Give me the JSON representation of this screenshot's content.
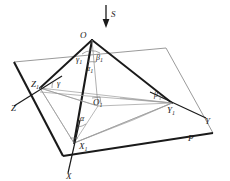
{
  "figure": {
    "colors": {
      "ink": "#1a1a1a",
      "thin": "#6a6a6a",
      "plane": "#8a8a8a",
      "background": "#ffffff"
    },
    "vertices": [
      {
        "id": "O",
        "label": "O",
        "sub": "",
        "x": 92,
        "y": 40,
        "label_x": 80,
        "label_y": 38
      },
      {
        "id": "X1",
        "label": "X",
        "sub": "1",
        "x": 74,
        "y": 143,
        "label_x": 79,
        "label_y": 149
      },
      {
        "id": "Y1",
        "label": "Y",
        "sub": "1",
        "x": 172,
        "y": 103,
        "label_x": 167,
        "label_y": 113
      },
      {
        "id": "Z1",
        "label": "Z",
        "sub": "1",
        "x": 40,
        "y": 88,
        "label_x": 31,
        "label_y": 87
      },
      {
        "id": "O1",
        "label": "O",
        "sub": "1",
        "x": 98,
        "y": 106,
        "label_x": 93,
        "label_y": 105
      }
    ],
    "axes": [
      {
        "id": "X",
        "label": "X",
        "tip_x": 68,
        "tip_y": 173,
        "label_x": 66,
        "label_y": 178
      },
      {
        "id": "Y",
        "label": "Y",
        "tip_x": 206,
        "tip_y": 118,
        "label_x": 206,
        "label_y": 123
      },
      {
        "id": "Z",
        "label": "Z",
        "tip_x": 14,
        "tip_y": 106,
        "label_x": 12,
        "label_y": 110
      }
    ],
    "direction": {
      "id": "S",
      "label": "S",
      "label_x": 111,
      "label_y": 16,
      "arrow_x": 106,
      "arrow_y_top": 5,
      "arrow_y_bottom": 27
    },
    "plane": {
      "id": "P",
      "label": "P",
      "label_x": 189,
      "label_y": 140
    },
    "angles": [
      {
        "id": "alpha",
        "label": "α",
        "sub": "",
        "x": 80,
        "y": 121
      },
      {
        "id": "beta",
        "label": "β",
        "sub": "",
        "x": 154,
        "y": 97
      },
      {
        "id": "gamma",
        "label": "γ",
        "sub": "",
        "x": 57,
        "y": 86
      },
      {
        "id": "alpha1",
        "label": "α",
        "sub": "1",
        "x": 88,
        "y": 70
      },
      {
        "id": "beta1",
        "label": "β",
        "sub": "1",
        "x": 97,
        "y": 59
      },
      {
        "id": "gamma1",
        "label": "γ",
        "sub": "1",
        "x": 78,
        "y": 61
      }
    ],
    "plane_outline": [
      {
        "x": 14,
        "y": 62
      },
      {
        "x": 166,
        "y": 48
      },
      {
        "x": 213,
        "y": 133
      },
      {
        "x": 63,
        "y": 156
      }
    ],
    "thick_edges": [
      {
        "from": "O",
        "to": "Z1"
      },
      {
        "from": "O",
        "to": "X1"
      },
      {
        "from": "O",
        "to": "Y1"
      }
    ],
    "thin_edges": [
      {
        "from": "Z1",
        "to": "X1"
      },
      {
        "from": "X1",
        "to": "Y1"
      },
      {
        "from": "Z1",
        "to": "Y1"
      },
      {
        "from": "O1",
        "to": "X1"
      },
      {
        "from": "O1",
        "to": "Y1"
      },
      {
        "from": "O1",
        "to": "Z1"
      },
      {
        "from": "O",
        "to": "O1"
      }
    ]
  }
}
